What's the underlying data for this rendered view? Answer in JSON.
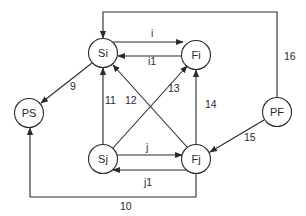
{
  "diagram": {
    "type": "directed-graph",
    "colors": {
      "stroke": "#2a2a2a",
      "background": "#ffffff"
    },
    "nodes": [
      {
        "id": "Si",
        "label": "Si",
        "x": 103,
        "y": 53
      },
      {
        "id": "Fi",
        "label": "Fi",
        "x": 196,
        "y": 55
      },
      {
        "id": "Sj",
        "label": "Sj",
        "x": 103,
        "y": 159
      },
      {
        "id": "Fj",
        "label": "Fj",
        "x": 196,
        "y": 159
      },
      {
        "id": "PS",
        "label": "PS",
        "x": 29,
        "y": 113
      },
      {
        "id": "PF",
        "label": "PF",
        "x": 277,
        "y": 112
      }
    ],
    "edges": [
      {
        "label": "i",
        "from": "Si",
        "to": "Fi"
      },
      {
        "label": "i1",
        "from": "Fi",
        "to": "Si"
      },
      {
        "label": "j",
        "from": "Sj",
        "to": "Fj"
      },
      {
        "label": "j1",
        "from": "Fj",
        "to": "Sj"
      },
      {
        "label": "9",
        "from": "Si",
        "to": "PS"
      },
      {
        "label": "10",
        "from": "Fj",
        "to": "PS"
      },
      {
        "label": "11",
        "from": "Sj",
        "to": "Si"
      },
      {
        "label": "12",
        "from": "Fj",
        "to": "Si"
      },
      {
        "label": "13",
        "from": "Sj",
        "to": "Fi"
      },
      {
        "label": "14",
        "from": "Fj",
        "to": "Fi"
      },
      {
        "label": "15",
        "from": "PF",
        "to": "Fj"
      },
      {
        "label": "16",
        "from": "PF",
        "to": "Si"
      }
    ]
  }
}
